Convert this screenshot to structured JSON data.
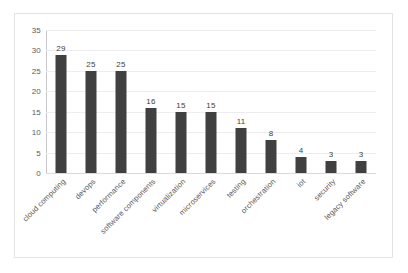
{
  "chart_data": {
    "type": "bar",
    "title": "",
    "subtitle": "",
    "xlabel": "",
    "ylabel": "",
    "ylim": [
      0,
      35
    ],
    "yticks": [
      0,
      5,
      10,
      15,
      20,
      25,
      30,
      35
    ],
    "grid": "horizontal",
    "legend": "none",
    "bar_color": "#404040",
    "categories": [
      "cloud computing",
      "devops",
      "performance",
      "software components",
      "virtualization",
      "microservices",
      "testing",
      "orchestration",
      "iot",
      "security",
      "legacy software"
    ],
    "values": [
      29,
      25,
      25,
      16,
      15,
      15,
      11,
      8,
      4,
      3,
      3
    ],
    "data_labels": [
      "29",
      "25",
      "25",
      "16",
      "15",
      "15",
      "11",
      "8",
      "4",
      "3",
      "3"
    ],
    "ytick_labels": [
      "0",
      "5",
      "10",
      "15",
      "20",
      "25",
      "30",
      "35"
    ]
  }
}
